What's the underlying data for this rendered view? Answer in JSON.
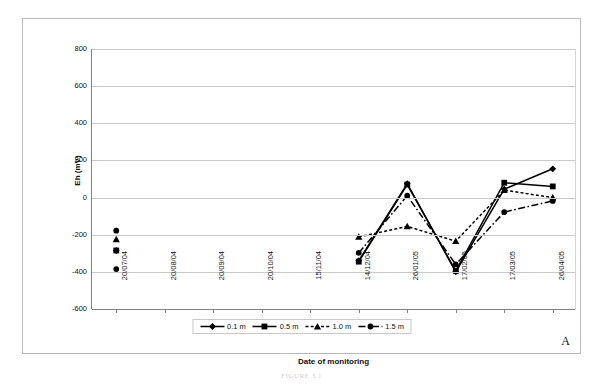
{
  "chart_data": {
    "type": "line",
    "title": "",
    "xlabel": "Date of monitoring",
    "ylabel": "Eh (mV)",
    "ylim": [
      -600,
      800
    ],
    "yticks": [
      800,
      600,
      400,
      200,
      0,
      -200,
      -400,
      -600
    ],
    "grid": true,
    "legend_position": "bottom",
    "panel_label": "A",
    "categories": [
      "20/07/04",
      "20/08/04",
      "20/09/04",
      "20/10/04",
      "15/11/04",
      "14/12/04",
      "26/01/05",
      "17/02/05",
      "17/03/05",
      "26/04/05"
    ],
    "series": [
      {
        "name": "0.1 m",
        "marker": "diamond",
        "line": "solid",
        "values": [
          -285,
          null,
          null,
          null,
          null,
          -340,
          75,
          -400,
          45,
          155
        ]
      },
      {
        "name": "0.5 m",
        "marker": "square",
        "line": "solid",
        "values": [
          -285,
          null,
          null,
          null,
          null,
          -345,
          70,
          -395,
          80,
          60
        ]
      },
      {
        "name": "1.0 m",
        "marker": "triangle",
        "line": "dotted",
        "values": [
          -225,
          null,
          null,
          null,
          null,
          -212,
          -155,
          -235,
          40,
          0
        ]
      },
      {
        "name": "1.5 m",
        "marker": "circle",
        "line": "dashdot",
        "values": [
          -385,
          null,
          null,
          null,
          null,
          -298,
          10,
          -360,
          -78,
          -18
        ]
      }
    ],
    "extra_points": [
      {
        "series": "1.5 m",
        "category": "20/07/04",
        "value": -178,
        "marker": "circle"
      }
    ]
  },
  "figure": {
    "caption": "FIGURE 3.1"
  },
  "colors": {
    "series": "#000000",
    "gridline": "#c9c9c9",
    "axis": "#808080",
    "frame": "#b9b9b9",
    "background": "#ffffff"
  }
}
